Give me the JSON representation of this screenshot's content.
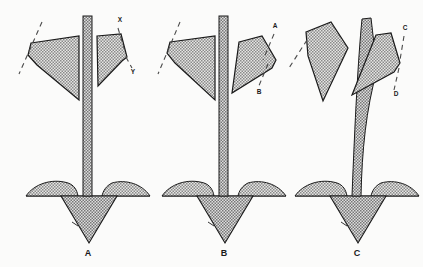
{
  "figure": {
    "background_color": "#fbfbfa",
    "ink_color": "#1a1a1a",
    "fill_color": "#9d9d9d",
    "stem_color": "#8f8f8f",
    "width": 423,
    "height": 267
  },
  "panels": [
    {
      "id": "panel-a",
      "label": "A",
      "label_x": 88,
      "label_y": 256,
      "description": "upright stem with two opposed shaded blades",
      "annotations": [
        {
          "id": "x",
          "text": "X",
          "x": 120,
          "y": 22
        },
        {
          "id": "y",
          "text": "Y",
          "x": 133,
          "y": 74
        }
      ]
    },
    {
      "id": "panel-b",
      "label": "B",
      "label_x": 224,
      "label_y": 256,
      "description": "upright stem with right blade rotated downward",
      "annotations": [
        {
          "id": "a",
          "text": "A",
          "x": 275,
          "y": 28
        },
        {
          "id": "b",
          "text": "B",
          "x": 259,
          "y": 94
        }
      ]
    },
    {
      "id": "panel-c",
      "label": "C",
      "label_x": 357,
      "label_y": 256,
      "description": "curved leaning stem with both blades rotated",
      "annotations": [
        {
          "id": "c",
          "text": "C",
          "x": 405,
          "y": 30
        },
        {
          "id": "d",
          "text": "D",
          "x": 396,
          "y": 96
        }
      ]
    }
  ],
  "legend_note": ""
}
